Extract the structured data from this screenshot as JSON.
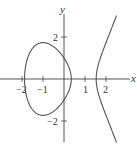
{
  "chart_data": {
    "type": "line",
    "title": "",
    "equation": "y^2 = x^3 - 3x + 1",
    "xlabel": "x",
    "ylabel": "y",
    "xlim": [
      -3.0,
      3.3
    ],
    "ylim": [
      -3.2,
      3.7
    ],
    "grid": false,
    "legend": null,
    "x_ticks": [
      -2,
      -1,
      1,
      2
    ],
    "x_tick_labels": [
      "−2",
      "−1",
      "1",
      "2"
    ],
    "y_ticks": [
      2,
      -2
    ],
    "y_tick_labels": [
      "2",
      "−2"
    ],
    "series": [
      {
        "name": "oval (bounded component)",
        "x_range": [
          -1.879,
          0.347
        ],
        "points": [
          [
            -1.879,
            0
          ],
          [
            -1.8,
            0.77
          ],
          [
            -1.6,
            1.22
          ],
          [
            -1.4,
            1.48
          ],
          [
            -1.2,
            1.64
          ],
          [
            -1.0,
            1.73
          ],
          [
            -0.8,
            1.76
          ],
          [
            -0.6,
            1.73
          ],
          [
            -0.4,
            1.64
          ],
          [
            -0.2,
            1.47
          ],
          [
            0,
            1.0
          ],
          [
            0.2,
            0.63
          ],
          [
            0.347,
            0
          ]
        ]
      },
      {
        "name": "unbounded branch",
        "x_range": [
          1.532,
          2.5
        ],
        "points": [
          [
            1.532,
            0
          ],
          [
            1.6,
            0.58
          ],
          [
            1.8,
            1.21
          ],
          [
            2.0,
            1.73
          ],
          [
            2.2,
            2.22
          ],
          [
            2.4,
            2.7
          ],
          [
            2.5,
            3.02
          ]
        ]
      }
    ],
    "colors": {
      "curve": "#555555",
      "axes": "#444444"
    }
  },
  "labels": {
    "x_axis": "x",
    "y_axis": "y",
    "tick_x_m2": "−2",
    "tick_x_m1": "−1",
    "tick_x_1": "1",
    "tick_x_2": "2",
    "tick_y_2": "2",
    "tick_y_m2": "−2"
  }
}
